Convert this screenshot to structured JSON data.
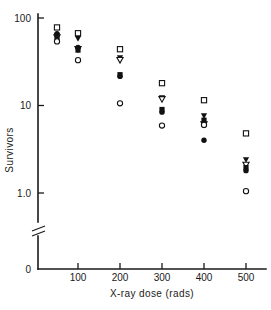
{
  "chart_data": {
    "type": "scatter",
    "title": "",
    "xlabel": "X-ray dose (rads)",
    "ylabel": "Survivors",
    "xlim": [
      0,
      550
    ],
    "ylim": [
      1.0,
      100
    ],
    "yscale": "log",
    "y_axis_break": true,
    "y_axis_break_note": "axis broken between 1.0 and 0",
    "grid": false,
    "legend": "none",
    "xticks": [
      100,
      200,
      300,
      400,
      500
    ],
    "xtick_labels": [
      "100",
      "200",
      "300",
      "400",
      "500"
    ],
    "yticks": [
      1.0,
      10,
      100
    ],
    "ytick_labels": [
      "1.0",
      "10",
      "100"
    ],
    "origin_label": "0",
    "series": [
      {
        "name": "open-square",
        "marker": "open-square",
        "x": [
          50,
          100,
          200,
          300,
          400,
          500
        ],
        "values": [
          78,
          67,
          44,
          18,
          11.5,
          4.8
        ]
      },
      {
        "name": "filled-triangle-down",
        "marker": "filled-triangle-down",
        "x": [
          50,
          100,
          200,
          300,
          400,
          500
        ],
        "values": [
          63,
          58,
          35,
          12.2,
          7.6,
          2.4
        ]
      },
      {
        "name": "open-triangle-down",
        "marker": "open-triangle-down",
        "x": [
          50,
          100,
          200,
          300,
          400,
          500
        ],
        "values": [
          60,
          44,
          33,
          11.8,
          6.1,
          2.1
        ]
      },
      {
        "name": "filled-square",
        "marker": "filled-square",
        "x": [
          50,
          100,
          200,
          300,
          400,
          500
        ],
        "values": [
          58,
          43,
          22.5,
          9.0,
          6.8,
          1.95
        ]
      },
      {
        "name": "filled-circle",
        "marker": "filled-circle",
        "x": [
          50,
          100,
          200,
          300,
          400,
          500
        ],
        "values": [
          66,
          46,
          21.5,
          8.4,
          4.0,
          1.8
        ]
      },
      {
        "name": "open-circle",
        "marker": "open-circle",
        "x": [
          50,
          100,
          200,
          300,
          400,
          500
        ],
        "values": [
          54,
          33,
          10.6,
          5.9,
          6.0,
          1.05
        ]
      }
    ]
  }
}
